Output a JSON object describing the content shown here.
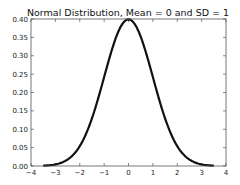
{
  "chart_data": {
    "type": "line",
    "title": "Normal Distribution, Mean = 0 and SD = 1",
    "xlabel": "",
    "ylabel": "",
    "xlim": [
      -4,
      4
    ],
    "ylim": [
      0,
      0.4
    ],
    "x_ticks": [
      "−4",
      "−3",
      "−2",
      "−1",
      "0",
      "1",
      "2",
      "3",
      "4"
    ],
    "y_ticks": [
      "0.00",
      "0.05",
      "0.10",
      "0.15",
      "0.20",
      "0.25",
      "0.30",
      "0.35",
      "0.40"
    ],
    "grid": false,
    "legend": null,
    "series": [
      {
        "name": "pdf",
        "color": "#111111",
        "mean": 0,
        "sd": 1,
        "x_range": [
          -3.5,
          3.5
        ],
        "x": [
          -3.5,
          -3.0,
          -2.5,
          -2.0,
          -1.5,
          -1.0,
          -0.5,
          0.0,
          0.5,
          1.0,
          1.5,
          2.0,
          2.5,
          3.0,
          3.5
        ],
        "values": [
          0.0009,
          0.0044,
          0.0175,
          0.054,
          0.1295,
          0.242,
          0.3521,
          0.3989,
          0.3521,
          0.242,
          0.1295,
          0.054,
          0.0175,
          0.0044,
          0.0009
        ]
      }
    ]
  }
}
